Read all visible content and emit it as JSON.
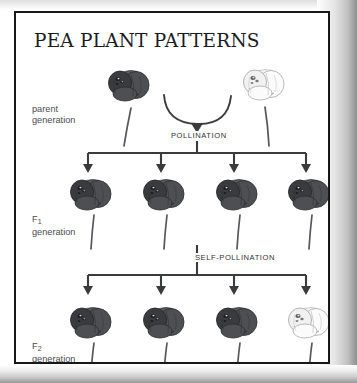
{
  "page": {
    "title": "PEA PLANT PATTERNS",
    "background_color": "#ffffff",
    "border_color": "#17181a"
  },
  "labels": {
    "parent_line1": "parent",
    "parent_line2": "generation",
    "f1_letter": "F",
    "f1_subscript": "1",
    "f1_line2": "generation",
    "f2_letter": "F",
    "f2_subscript": "2",
    "f2_line2": "generation"
  },
  "captions": {
    "pollination": "POLLINATION",
    "self_pollination": "SELF-POLLINATION"
  },
  "diagram": {
    "type": "punnett-inheritance-cross",
    "colors": {
      "dominant_flower": "#4e4f52",
      "recessive_flower": "#fbfbfb",
      "stem": "#56575a",
      "connector": "#3a3b3d",
      "text": "#303133"
    },
    "generations": [
      {
        "name": "parent",
        "flower_count": 2,
        "flowers": [
          {
            "phenotype": "purple",
            "color": "#4e4f52",
            "x": 75,
            "y": 62
          },
          {
            "phenotype": "white",
            "color": "#fbfbfb",
            "x": 231,
            "y": 62
          }
        ]
      },
      {
        "name": "F1",
        "flower_count": 4,
        "flowers": [
          {
            "phenotype": "purple",
            "color": "#4e4f52",
            "x": 58,
            "y": 175
          },
          {
            "phenotype": "purple",
            "color": "#4e4f52",
            "x": 134,
            "y": 175
          },
          {
            "phenotype": "purple",
            "color": "#4e4f52",
            "x": 211,
            "y": 175
          },
          {
            "phenotype": "purple",
            "color": "#4e4f52",
            "x": 288,
            "y": 175
          }
        ]
      },
      {
        "name": "F2",
        "flower_count": 4,
        "ratio": "3:1",
        "flowers": [
          {
            "phenotype": "purple",
            "color": "#4e4f52",
            "x": 58,
            "y": 303
          },
          {
            "phenotype": "purple",
            "color": "#4e4f52",
            "x": 134,
            "y": 303
          },
          {
            "phenotype": "purple",
            "color": "#4e4f52",
            "x": 211,
            "y": 303
          },
          {
            "phenotype": "white",
            "color": "#fbfbfb",
            "x": 288,
            "y": 303
          }
        ]
      }
    ]
  }
}
